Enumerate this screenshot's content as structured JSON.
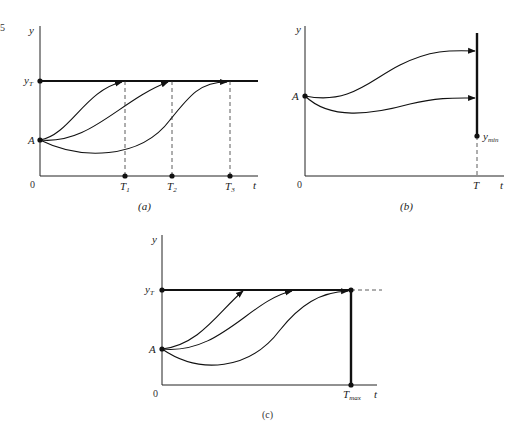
{
  "edge_fragment": "5",
  "panels": [
    {
      "id": "a",
      "caption": "(a)",
      "axis_x": "t",
      "axis_y": "y",
      "origin": "0",
      "start_label": "A",
      "target_label": "y",
      "target_sub": "T",
      "ticks": [
        {
          "main": "T",
          "sub": "1"
        },
        {
          "main": "T",
          "sub": "2"
        },
        {
          "main": "T",
          "sub": "3"
        }
      ]
    },
    {
      "id": "b",
      "caption": "(b)",
      "axis_x": "t",
      "axis_y": "y",
      "origin": "0",
      "start_label": "A",
      "end_tick": "T",
      "min_label": "y",
      "min_sub": "min"
    },
    {
      "id": "c",
      "caption": "(c)",
      "axis_x": "t",
      "axis_y": "y",
      "origin": "0",
      "start_label": "A",
      "target_label": "y",
      "target_sub": "T",
      "end_tick": "T",
      "end_sub": "max"
    }
  ]
}
